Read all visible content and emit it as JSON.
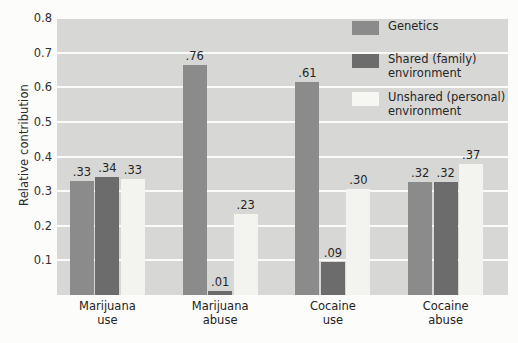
{
  "chart_data": {
    "type": "bar",
    "title": "",
    "xlabel": "",
    "ylabel": "Relative contribution",
    "ylim": [
      0,
      0.8
    ],
    "ytick_labels": [
      "0.8",
      "0.7",
      "0.6",
      "0.5",
      "0.4",
      "0.3",
      "0.2",
      "0.1"
    ],
    "ytick_values": [
      0.8,
      0.7,
      0.6,
      0.5,
      0.4,
      0.3,
      0.2,
      0.1
    ],
    "grid": true,
    "legend_position": "top-right",
    "categories": [
      "Marijuana use",
      "Marijuana abuse",
      "Cocaine use",
      "Cocaine abuse"
    ],
    "category_lines": [
      [
        "Marijuana",
        "use"
      ],
      [
        "Marijuana",
        "abuse"
      ],
      [
        "Cocaine",
        "use"
      ],
      [
        "Cocaine",
        "abuse"
      ]
    ],
    "series": [
      {
        "name": "Genetics",
        "color": "#8b8b8b",
        "values": [
          0.33,
          0.76,
          0.61,
          0.32
        ],
        "labels": [
          ".33",
          ".76",
          ".61",
          ".32"
        ],
        "plotted_heights": [
          0.328,
          0.665,
          0.615,
          0.327
        ]
      },
      {
        "name": "Shared (family) environment",
        "color": "#6c6c6c",
        "values": [
          0.34,
          0.01,
          0.09,
          0.32
        ],
        "labels": [
          ".34",
          ".01",
          ".09",
          ".32"
        ],
        "plotted_heights": [
          0.342,
          0.012,
          0.095,
          0.327
        ]
      },
      {
        "name": "Unshared (personal) environment",
        "color": "#f3f3f0",
        "values": [
          0.33,
          0.23,
          0.3,
          0.37
        ],
        "labels": [
          ".33",
          ".23",
          ".30",
          ".37"
        ],
        "plotted_heights": [
          0.335,
          0.235,
          0.305,
          0.378
        ]
      }
    ]
  },
  "legend": {
    "items": [
      {
        "label_lines": [
          "Genetics"
        ]
      },
      {
        "label_lines": [
          "Shared (family)",
          "environment"
        ]
      },
      {
        "label_lines": [
          "Unshared (personal)",
          "environment"
        ]
      }
    ]
  },
  "colors": {
    "panel_background": "#d7d7d5",
    "gridline": "#fbfbfa",
    "figure_background": "#fcfcfa",
    "text": "#262626"
  }
}
